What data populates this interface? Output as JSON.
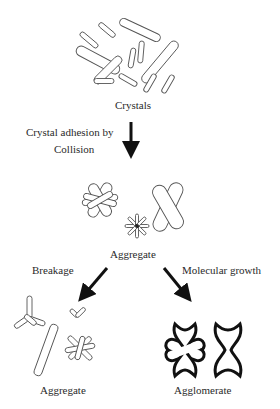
{
  "diagram": {
    "type": "process-flow",
    "nodes": {
      "crystals": {
        "label": "Crystals"
      },
      "aggregate_mid": {
        "label": "Aggregate"
      },
      "aggregate_broken": {
        "label": "Aggregate"
      },
      "agglomerate": {
        "label": "Agglomerate"
      }
    },
    "edges": {
      "collision": {
        "label_line1": "Crystal adhesion by",
        "label_line2": "Collision"
      },
      "breakage": {
        "label": "Breakage"
      },
      "growth": {
        "label": "Molecular growth"
      }
    },
    "colors": {
      "outline": "#555555",
      "arrow": "#111111",
      "text": "#2a2a2a"
    }
  }
}
